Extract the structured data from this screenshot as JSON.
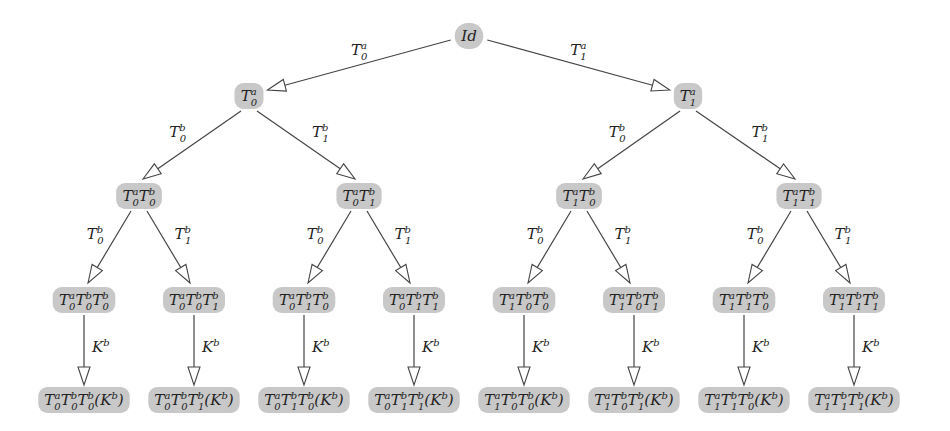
{
  "diagram": {
    "type": "tree",
    "colors": {
      "node_fill": "#c8c8c8",
      "edge": "#444444",
      "background": "#ffffff"
    },
    "nodes": [
      {
        "id": "root",
        "x": 469,
        "y": 36,
        "parts": [
          [
            "I",
            ""
          ],
          [
            "d",
            ""
          ]
        ],
        "label": "Id"
      },
      {
        "id": "a0",
        "x": 249,
        "y": 96,
        "parts": [
          [
            "T",
            "0",
            "a"
          ]
        ],
        "label": "T0^a"
      },
      {
        "id": "a1",
        "x": 688,
        "y": 96,
        "parts": [
          [
            "T",
            "1",
            "a"
          ]
        ],
        "label": "T1^a"
      },
      {
        "id": "a0b0",
        "x": 139,
        "y": 196,
        "parts": [
          [
            "T",
            "0",
            "a"
          ],
          [
            "T",
            "0",
            "b"
          ]
        ],
        "label": "T0^a T0^b"
      },
      {
        "id": "a0b1",
        "x": 359,
        "y": 196,
        "parts": [
          [
            "T",
            "0",
            "a"
          ],
          [
            "T",
            "1",
            "b"
          ]
        ],
        "label": "T0^a T1^b"
      },
      {
        "id": "a1b0",
        "x": 579,
        "y": 196,
        "parts": [
          [
            "T",
            "1",
            "a"
          ],
          [
            "T",
            "0",
            "b"
          ]
        ],
        "label": "T1^a T0^b"
      },
      {
        "id": "a1b1",
        "x": 799,
        "y": 196,
        "parts": [
          [
            "T",
            "1",
            "a"
          ],
          [
            "T",
            "1",
            "b"
          ]
        ],
        "label": "T1^a T1^b"
      },
      {
        "id": "a0b0b0",
        "x": 84,
        "y": 300,
        "parts": [
          [
            "T",
            "0",
            "a"
          ],
          [
            "T",
            "0",
            "b"
          ],
          [
            "T",
            "0",
            "b"
          ]
        ],
        "label": "T0^a T0^b T0^b"
      },
      {
        "id": "a0b0b1",
        "x": 194,
        "y": 300,
        "parts": [
          [
            "T",
            "0",
            "a"
          ],
          [
            "T",
            "0",
            "b"
          ],
          [
            "T",
            "1",
            "b"
          ]
        ],
        "label": "T0^a T0^b T1^b"
      },
      {
        "id": "a0b1b0",
        "x": 304,
        "y": 300,
        "parts": [
          [
            "T",
            "0",
            "a"
          ],
          [
            "T",
            "1",
            "b"
          ],
          [
            "T",
            "0",
            "b"
          ]
        ],
        "label": "T0^a T1^b T0^b"
      },
      {
        "id": "a0b1b1",
        "x": 414,
        "y": 300,
        "parts": [
          [
            "T",
            "0",
            "a"
          ],
          [
            "T",
            "1",
            "b"
          ],
          [
            "T",
            "1",
            "b"
          ]
        ],
        "label": "T0^a T1^b T1^b"
      },
      {
        "id": "a1b0b0",
        "x": 524,
        "y": 300,
        "parts": [
          [
            "T",
            "1",
            "a"
          ],
          [
            "T",
            "0",
            "b"
          ],
          [
            "T",
            "0",
            "b"
          ]
        ],
        "label": "T1^a T0^b T0^b"
      },
      {
        "id": "a1b0b1",
        "x": 634,
        "y": 300,
        "parts": [
          [
            "T",
            "1",
            "a"
          ],
          [
            "T",
            "0",
            "b"
          ],
          [
            "T",
            "1",
            "b"
          ]
        ],
        "label": "T1^a T0^b T1^b"
      },
      {
        "id": "a1b1b0",
        "x": 744,
        "y": 300,
        "parts": [
          [
            "T",
            "1",
            "a"
          ],
          [
            "T",
            "1",
            "b"
          ],
          [
            "T",
            "0",
            "b"
          ]
        ],
        "label": "T1^a T1^b T0^b"
      },
      {
        "id": "a1b1b1",
        "x": 854,
        "y": 300,
        "parts": [
          [
            "T",
            "1",
            "a"
          ],
          [
            "T",
            "1",
            "b"
          ],
          [
            "T",
            "1",
            "b"
          ]
        ],
        "label": "T1^a T1^b T1^b"
      },
      {
        "id": "k1",
        "x": 84,
        "y": 400,
        "parts": [
          [
            "T",
            "0",
            "a"
          ],
          [
            "T",
            "0",
            "b"
          ],
          [
            "T",
            "0",
            "b"
          ],
          [
            "(K",
            "",
            "b"
          ],
          [
            ")",
            ""
          ]
        ],
        "label": "T0^a T0^b T0^b (K^b)"
      },
      {
        "id": "k2",
        "x": 194,
        "y": 400,
        "parts": [
          [
            "T",
            "0",
            "a"
          ],
          [
            "T",
            "0",
            "b"
          ],
          [
            "T",
            "1",
            "b"
          ],
          [
            "(K",
            "",
            "b"
          ],
          [
            ")",
            ""
          ]
        ],
        "label": "T0^a T0^b T1^b (K^b)"
      },
      {
        "id": "k3",
        "x": 304,
        "y": 400,
        "parts": [
          [
            "T",
            "0",
            "a"
          ],
          [
            "T",
            "1",
            "b"
          ],
          [
            "T",
            "0",
            "b"
          ],
          [
            "(K",
            "",
            "b"
          ],
          [
            ")",
            ""
          ]
        ],
        "label": "T0^a T1^b T0^b (K^b)"
      },
      {
        "id": "k4",
        "x": 414,
        "y": 400,
        "parts": [
          [
            "T",
            "0",
            "a"
          ],
          [
            "T",
            "1",
            "b"
          ],
          [
            "T",
            "1",
            "b"
          ],
          [
            "(K",
            "",
            "b"
          ],
          [
            ")",
            ""
          ]
        ],
        "label": "T0^a T1^b T1^b (K^b)"
      },
      {
        "id": "k5",
        "x": 524,
        "y": 400,
        "parts": [
          [
            "T",
            "1",
            "a"
          ],
          [
            "T",
            "0",
            "b"
          ],
          [
            "T",
            "0",
            "b"
          ],
          [
            "(K",
            "",
            "b"
          ],
          [
            ")",
            ""
          ]
        ],
        "label": "T1^a T0^b T0^b (K^b)"
      },
      {
        "id": "k6",
        "x": 634,
        "y": 400,
        "parts": [
          [
            "T",
            "1",
            "a"
          ],
          [
            "T",
            "0",
            "b"
          ],
          [
            "T",
            "1",
            "b"
          ],
          [
            "(K",
            "",
            "b"
          ],
          [
            ")",
            ""
          ]
        ],
        "label": "T1^a T0^b T1^b (K^b)"
      },
      {
        "id": "k7",
        "x": 744,
        "y": 400,
        "parts": [
          [
            "T",
            "1",
            "a"
          ],
          [
            "T",
            "1",
            "b"
          ],
          [
            "T",
            "0",
            "b"
          ],
          [
            "(K",
            "",
            "b"
          ],
          [
            ")",
            ""
          ]
        ],
        "label": "T1^a T1^b T0^b (K^b)"
      },
      {
        "id": "k8",
        "x": 854,
        "y": 400,
        "parts": [
          [
            "T",
            "1",
            "a"
          ],
          [
            "T",
            "1",
            "b"
          ],
          [
            "T",
            "1",
            "b"
          ],
          [
            "(K",
            "",
            "b"
          ],
          [
            ")",
            ""
          ]
        ],
        "label": "T1^a T1^b T1^b (K^b)"
      }
    ],
    "edges": [
      {
        "from": "root",
        "to": "a0",
        "label": [
          "T",
          "0",
          "a"
        ]
      },
      {
        "from": "root",
        "to": "a1",
        "label": [
          "T",
          "1",
          "a"
        ]
      },
      {
        "from": "a0",
        "to": "a0b0",
        "label": [
          "T",
          "0",
          "b"
        ]
      },
      {
        "from": "a0",
        "to": "a0b1",
        "label": [
          "T",
          "1",
          "b"
        ]
      },
      {
        "from": "a1",
        "to": "a1b0",
        "label": [
          "T",
          "0",
          "b"
        ]
      },
      {
        "from": "a1",
        "to": "a1b1",
        "label": [
          "T",
          "1",
          "b"
        ]
      },
      {
        "from": "a0b0",
        "to": "a0b0b0",
        "label": [
          "T",
          "0",
          "b"
        ]
      },
      {
        "from": "a0b0",
        "to": "a0b0b1",
        "label": [
          "T",
          "1",
          "b"
        ]
      },
      {
        "from": "a0b1",
        "to": "a0b1b0",
        "label": [
          "T",
          "0",
          "b"
        ]
      },
      {
        "from": "a0b1",
        "to": "a0b1b1",
        "label": [
          "T",
          "1",
          "b"
        ]
      },
      {
        "from": "a1b0",
        "to": "a1b0b0",
        "label": [
          "T",
          "0",
          "b"
        ]
      },
      {
        "from": "a1b0",
        "to": "a1b0b1",
        "label": [
          "T",
          "1",
          "b"
        ]
      },
      {
        "from": "a1b1",
        "to": "a1b1b0",
        "label": [
          "T",
          "0",
          "b"
        ]
      },
      {
        "from": "a1b1",
        "to": "a1b1b1",
        "label": [
          "T",
          "1",
          "b"
        ]
      },
      {
        "from": "a0b0b0",
        "to": "k1",
        "label": [
          "K",
          "",
          "b"
        ]
      },
      {
        "from": "a0b0b1",
        "to": "k2",
        "label": [
          "K",
          "",
          "b"
        ]
      },
      {
        "from": "a0b1b0",
        "to": "k3",
        "label": [
          "K",
          "",
          "b"
        ]
      },
      {
        "from": "a0b1b1",
        "to": "k4",
        "label": [
          "K",
          "",
          "b"
        ]
      },
      {
        "from": "a1b0b0",
        "to": "k5",
        "label": [
          "K",
          "",
          "b"
        ]
      },
      {
        "from": "a1b0b1",
        "to": "k6",
        "label": [
          "K",
          "",
          "b"
        ]
      },
      {
        "from": "a1b1b0",
        "to": "k7",
        "label": [
          "K",
          "",
          "b"
        ]
      },
      {
        "from": "a1b1b1",
        "to": "k8",
        "label": [
          "K",
          "",
          "b"
        ]
      }
    ]
  }
}
